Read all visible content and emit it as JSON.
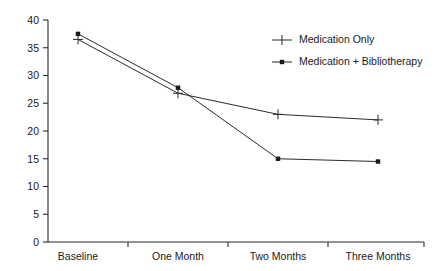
{
  "chart_data": {
    "type": "line",
    "title": "",
    "subtitle": "",
    "xlabel": "",
    "ylabel": "",
    "categories": [
      "Baseline",
      "One Month",
      "Two Months",
      "Three Months"
    ],
    "series": [
      {
        "name": "Medication Only",
        "marker": "plus",
        "values": [
          36.5,
          26.8,
          23.0,
          22.0
        ]
      },
      {
        "name": "Medication + Bibliotherapy",
        "marker": "dot",
        "values": [
          37.5,
          27.8,
          15.0,
          14.5
        ]
      }
    ],
    "ylim": [
      0,
      40
    ],
    "y_ticks": [
      0,
      5,
      10,
      15,
      20,
      25,
      30,
      35,
      40
    ],
    "y_tick_labels": [
      "0",
      "5",
      "10",
      "15",
      "20",
      "25",
      "30",
      "35",
      "40"
    ],
    "grid": false,
    "legend_position": "top-right"
  },
  "legend": {
    "entries": [
      {
        "label": "Medication Only",
        "marker": "plus-marker-icon"
      },
      {
        "label": "Medication + Bibliotherapy",
        "marker": "dot-marker-icon"
      }
    ]
  },
  "colors": {
    "ink": "#2b2b2b",
    "background": "#ffffff"
  }
}
